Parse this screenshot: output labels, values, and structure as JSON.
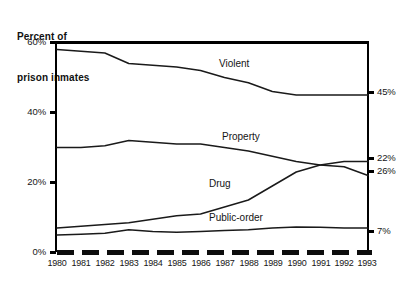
{
  "title": {
    "line1": "Percent of",
    "line2": "prison inmates"
  },
  "chart_data": {
    "type": "line",
    "title": "Percent of prison inmates",
    "xlabel": "",
    "ylabel": "Percent of prison inmates",
    "x": [
      1980,
      1981,
      1982,
      1983,
      1984,
      1985,
      1986,
      1987,
      1988,
      1989,
      1990,
      1991,
      1992,
      1993
    ],
    "categories": [
      "1980",
      "1981",
      "1982",
      "1983",
      "1984",
      "1985",
      "1986",
      "1987",
      "1988",
      "1989",
      "1990",
      "1991",
      "1992",
      "1993"
    ],
    "ylim": [
      0,
      60
    ],
    "yticks": [
      0,
      20,
      40,
      60
    ],
    "ytick_labels": [
      "0%",
      "20%",
      "40%",
      "60%"
    ],
    "grid": false,
    "legend": "inline-annotations",
    "series": [
      {
        "name": "Violent",
        "end_label": "45%",
        "values": [
          58,
          57.5,
          57,
          54,
          53.5,
          53,
          52,
          50,
          48.5,
          46,
          45,
          45,
          45,
          45
        ]
      },
      {
        "name": "Property",
        "end_label": "26%",
        "values": [
          30,
          30,
          30.5,
          32,
          31.5,
          31,
          31,
          30,
          29,
          27.5,
          26,
          25,
          24.5,
          22
        ]
      },
      {
        "name": "Drug",
        "end_label": "22%",
        "values": [
          7,
          7.5,
          8,
          8.5,
          9.5,
          10.5,
          11,
          13,
          15,
          19,
          23,
          25,
          26,
          26
        ]
      },
      {
        "name": "Public-order",
        "end_label": "7%",
        "values": [
          5,
          5.2,
          5.5,
          6.5,
          6,
          5.8,
          6,
          6.3,
          6.5,
          7,
          7.3,
          7.2,
          7,
          7
        ]
      }
    ],
    "annotations": [
      {
        "text": "Violent",
        "series": "Violent"
      },
      {
        "text": "Property",
        "series": "Property"
      },
      {
        "text": "Drug",
        "series": "Drug"
      },
      {
        "text": "Public-order",
        "series": "Public-order"
      }
    ],
    "baseline_style": "thick-dashed",
    "axis_color": "#000000",
    "line_color": "#1a1a1a"
  }
}
